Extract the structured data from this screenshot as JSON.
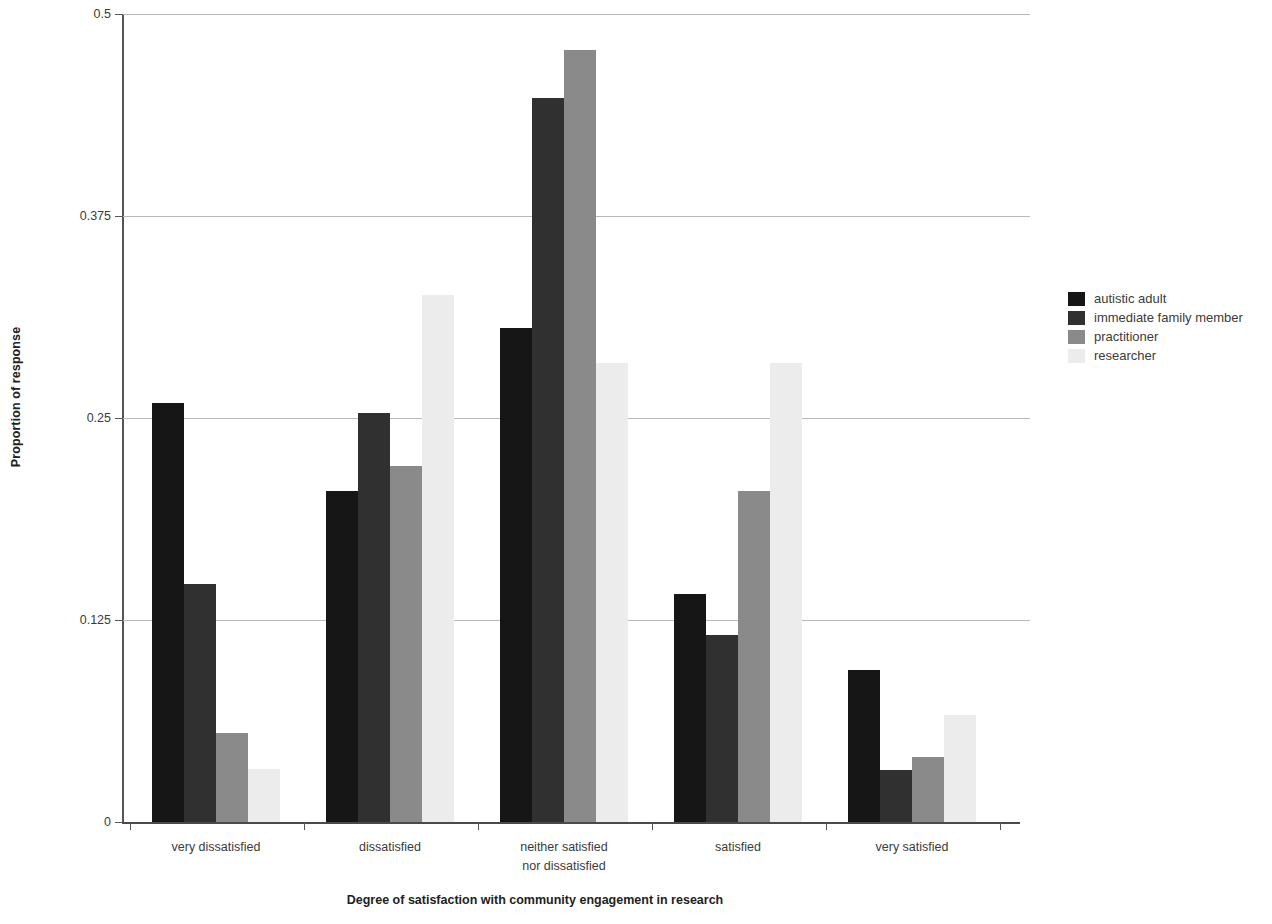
{
  "chart_data": {
    "type": "bar",
    "title": "",
    "xlabel": "Degree of satisfaction with community engagement in research",
    "ylabel": "Proportion of response",
    "categories": [
      "very dissatisfied",
      "dissatisfied",
      "neither satisfied\nnor dissatisfied",
      "satisfied",
      "very satisfied"
    ],
    "category_lines": [
      [
        "very dissatisfied"
      ],
      [
        "dissatisfied"
      ],
      [
        "neither satisfied",
        "nor dissatisfied"
      ],
      [
        "satisfied"
      ],
      [
        "very satisfied"
      ]
    ],
    "series": [
      {
        "name": "autistic adult",
        "color": "#161616",
        "values": [
          0.259,
          0.205,
          0.306,
          0.141,
          0.094
        ]
      },
      {
        "name": "immediate family member",
        "color": "#303030",
        "values": [
          0.147,
          0.253,
          0.448,
          0.116,
          0.032
        ]
      },
      {
        "name": "practitioner",
        "color": "#8a8a8a",
        "values": [
          0.055,
          0.22,
          0.478,
          0.205,
          0.04
        ]
      },
      {
        "name": "researcher",
        "color": "#ececec",
        "values": [
          0.033,
          0.326,
          0.284,
          0.284,
          0.066
        ]
      }
    ],
    "ylim": [
      0,
      0.5
    ],
    "yticks": [
      0,
      0.125,
      0.25,
      0.375,
      0.5
    ],
    "ytick_labels": [
      "0",
      "0.125",
      "0.25",
      "0.375",
      "0.5"
    ],
    "grid": true,
    "grid_axis": "y",
    "legend_position": "right",
    "background": "#ffffff",
    "axis_color": "#555555",
    "gridline_color": "#b9b9b9"
  },
  "legend": {
    "entries": [
      {
        "label": "autistic adult",
        "color": "#161616"
      },
      {
        "label": "immediate family member",
        "color": "#303030"
      },
      {
        "label": "practitioner",
        "color": "#8a8a8a"
      },
      {
        "label": "researcher",
        "color": "#ececec"
      }
    ]
  },
  "axes": {
    "y_title": "Proportion of response",
    "x_title": "Degree of satisfaction with community engagement in research"
  }
}
